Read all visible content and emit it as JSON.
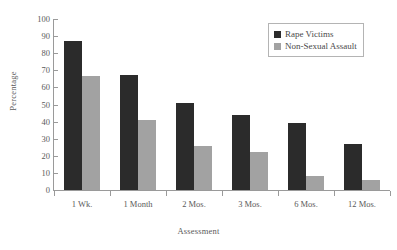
{
  "chart_data": {
    "type": "bar",
    "title": "",
    "subtitle": "",
    "xlabel": "Assessment",
    "ylabel": "Percentage",
    "categories": [
      "1 Wk.",
      "1 Month",
      "2 Mos.",
      "3 Mos.",
      "6 Mos.",
      "12 Mos."
    ],
    "series": [
      {
        "name": "Rape Victims",
        "color": "#2b2b2b",
        "values": [
          87,
          67.5,
          51,
          44,
          39,
          27
        ]
      },
      {
        "name": "Non-Sexual Assault",
        "color": "#a2a2a2",
        "values": [
          66.5,
          41,
          26,
          22,
          8,
          6
        ]
      }
    ],
    "ylim": [
      0,
      100
    ],
    "ytick_labels": [
      "100",
      "90",
      "80",
      "70",
      "60",
      "50",
      "40",
      "30",
      "20",
      "10",
      "0"
    ],
    "ytick_values": [
      100,
      90,
      80,
      70,
      60,
      50,
      40,
      30,
      20,
      10,
      0
    ],
    "grid": false,
    "legend_position": "top-right",
    "axis_color": "#9a9a9a",
    "text_color": "#5a5a5a",
    "background": "#ffffff"
  }
}
